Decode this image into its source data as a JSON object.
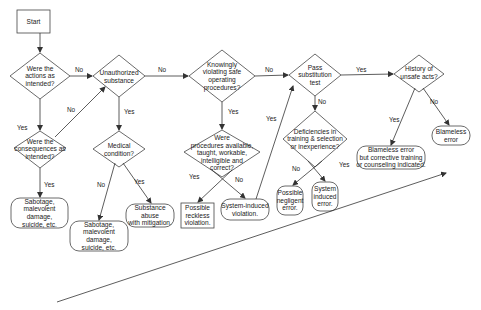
{
  "diagram": {
    "type": "decision-flowchart",
    "nodes": {
      "start": {
        "shape": "rectangle",
        "label": "Start"
      },
      "actions_intended": {
        "shape": "diamond",
        "label": "Were the\nactions as\nintended?"
      },
      "consequences_intended": {
        "shape": "diamond",
        "label": "Were the\nconsequences as\nintended?"
      },
      "sabotage_1": {
        "shape": "rounded",
        "label": "Sabotage,\nmalevolent damage,\nsuicide, etc."
      },
      "unauthorized_substance": {
        "shape": "diamond",
        "label": "Unauthorized\nsubstance"
      },
      "medical_condition": {
        "shape": "diamond",
        "label": "Medical\ncondition?"
      },
      "sabotage_2": {
        "shape": "rounded",
        "label": "Sabotage,\nmalevolent damage,\nsuicide, etc."
      },
      "substance_abuse": {
        "shape": "rounded",
        "label": "Substance abuse\nwith mitigation."
      },
      "knowingly_violating": {
        "shape": "diamond",
        "label": "Knowingly\nviolating safe\noperating\nprocedures?"
      },
      "procedures_available": {
        "shape": "diamond",
        "label": "Were\nprocedures available,\ntaught, workable,\nintelligible and\ncorrect?"
      },
      "reckless_violation": {
        "shape": "rectangle",
        "label": "Possible\nreckless\nviolation."
      },
      "system_induced_violation": {
        "shape": "rounded",
        "label": "System-induced\nviolation."
      },
      "pass_substitution": {
        "shape": "diamond",
        "label": "Pass\nsubstitution\ntest"
      },
      "deficiencies": {
        "shape": "diamond",
        "label": "Deficiencies in\ntraining & selection\nor inexperience?"
      },
      "negligent_error": {
        "shape": "rounded",
        "label": "Possible\nnegligent\nerror."
      },
      "system_induced_error": {
        "shape": "rounded",
        "label": "System\ninduced\nerror."
      },
      "history_unsafe": {
        "shape": "diamond",
        "label": "History of\nunsafe acts?"
      },
      "blameless_corrective": {
        "shape": "rounded",
        "label": "Blameless error\nbut corrective training\nor counseling indicated."
      },
      "blameless_error": {
        "shape": "rounded",
        "label": "Blameless\nerror"
      }
    },
    "edges": [
      {
        "from": "start",
        "to": "actions_intended",
        "label": ""
      },
      {
        "from": "actions_intended",
        "to": "unauthorized_substance",
        "label": "No"
      },
      {
        "from": "actions_intended",
        "to": "consequences_intended",
        "label": "Yes"
      },
      {
        "from": "consequences_intended",
        "to": "unauthorized_substance",
        "label": "No"
      },
      {
        "from": "consequences_intended",
        "to": "sabotage_1",
        "label": "Yes"
      },
      {
        "from": "unauthorized_substance",
        "to": "knowingly_violating",
        "label": "No"
      },
      {
        "from": "unauthorized_substance",
        "to": "medical_condition",
        "label": "Yes"
      },
      {
        "from": "medical_condition",
        "to": "sabotage_2",
        "label": "No"
      },
      {
        "from": "medical_condition",
        "to": "substance_abuse",
        "label": "Yes"
      },
      {
        "from": "knowingly_violating",
        "to": "pass_substitution",
        "label": "No"
      },
      {
        "from": "knowingly_violating",
        "to": "procedures_available",
        "label": "Yes"
      },
      {
        "from": "procedures_available",
        "to": "reckless_violation",
        "label": "Yes"
      },
      {
        "from": "procedures_available",
        "to": "system_induced_violation",
        "label": "No"
      },
      {
        "from": "system_induced_violation",
        "to": "pass_substitution",
        "label": "Yes"
      },
      {
        "from": "pass_substitution",
        "to": "history_unsafe",
        "label": "Yes"
      },
      {
        "from": "pass_substitution",
        "to": "deficiencies",
        "label": "No"
      },
      {
        "from": "deficiencies",
        "to": "negligent_error",
        "label": "No"
      },
      {
        "from": "deficiencies",
        "to": "system_induced_error",
        "label": "Yes"
      },
      {
        "from": "history_unsafe",
        "to": "blameless_corrective",
        "label": "Yes"
      },
      {
        "from": "history_unsafe",
        "to": "blameless_error",
        "label": "No"
      }
    ],
    "edge_labels": {
      "no": "No",
      "yes": "Yes"
    },
    "culpability_arrow": {
      "direction": "diagonal-up-right",
      "label": ""
    },
    "colors": {
      "stroke": "#333333",
      "background": "#ffffff",
      "text": "#222222"
    }
  }
}
